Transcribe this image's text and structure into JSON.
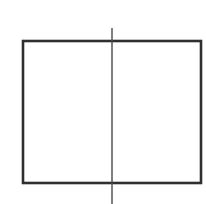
{
  "diagram": {
    "background": "#ffffff",
    "rectangle": {
      "x": 23,
      "y": 41,
      "width": 178,
      "height": 142,
      "stroke": "#2f2f2f",
      "stroke_width": 2.6,
      "fill": "none"
    },
    "vertical_line": {
      "x": 112,
      "y1": 28,
      "y2": 204,
      "stroke": "#4a4a4a",
      "stroke_width": 1.4
    }
  }
}
